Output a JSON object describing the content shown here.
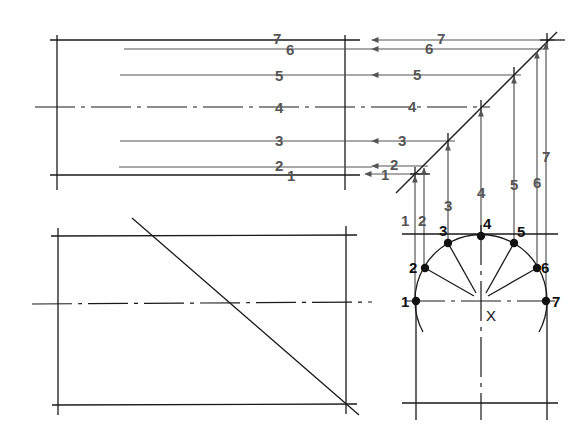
{
  "diagram": {
    "colors": {
      "line": "#1a1a1a",
      "projection": "#555555",
      "background": "#ffffff"
    },
    "top_view": {
      "projection_labels": [
        "1",
        "2",
        "3",
        "4",
        "5",
        "6",
        "7"
      ],
      "arrow_labels": [
        "1",
        "2",
        "3",
        "4",
        "5",
        "6",
        "7"
      ]
    },
    "vertical_projection_labels": [
      "1",
      "2",
      "3",
      "4",
      "5",
      "6",
      "7"
    ],
    "circle_view": {
      "point_labels": [
        "1",
        "2",
        "3",
        "4",
        "5",
        "6",
        "7"
      ],
      "center_label": "X"
    }
  }
}
